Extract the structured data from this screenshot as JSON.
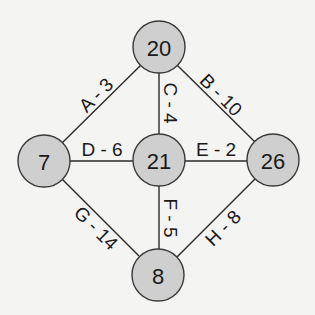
{
  "diagram": {
    "type": "weighted-graph",
    "nodes": [
      {
        "id": "n20",
        "label": "20",
        "x": 159,
        "y": 47
      },
      {
        "id": "n7",
        "label": "7",
        "x": 44,
        "y": 161
      },
      {
        "id": "n21",
        "label": "21",
        "x": 159,
        "y": 160
      },
      {
        "id": "n26",
        "label": "26",
        "x": 273,
        "y": 160
      },
      {
        "id": "n8",
        "label": "8",
        "x": 158,
        "y": 275
      }
    ],
    "edges": [
      {
        "id": "A",
        "label": "A - 3",
        "from": "n7",
        "to": "n20",
        "weight": 3
      },
      {
        "id": "B",
        "label": "B - 10",
        "from": "n20",
        "to": "n26",
        "weight": 10
      },
      {
        "id": "C",
        "label": "C - 4",
        "from": "n20",
        "to": "n21",
        "weight": 4
      },
      {
        "id": "D",
        "label": "D - 6",
        "from": "n7",
        "to": "n21",
        "weight": 6
      },
      {
        "id": "E",
        "label": "E - 2",
        "from": "n21",
        "to": "n26",
        "weight": 2
      },
      {
        "id": "F",
        "label": "F - 5",
        "from": "n21",
        "to": "n8",
        "weight": 5
      },
      {
        "id": "G",
        "label": "G - 14",
        "from": "n7",
        "to": "n8",
        "weight": 14
      },
      {
        "id": "H",
        "label": "H - 8",
        "from": "n8",
        "to": "n26",
        "weight": 8
      }
    ]
  },
  "colors": {
    "background": "#f4f4f2",
    "node_fill": "#cfcfcf",
    "stroke": "#2a2a2a",
    "text": "#1a1a1a"
  }
}
